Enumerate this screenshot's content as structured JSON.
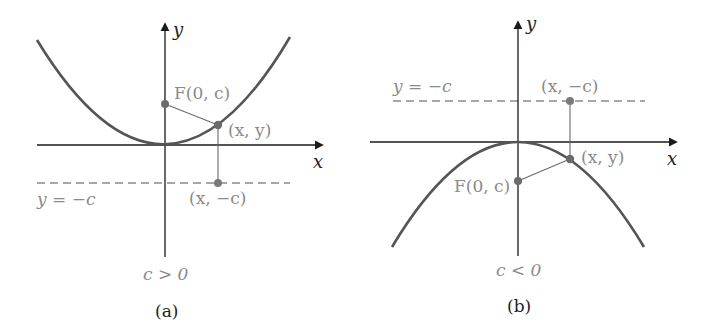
{
  "figure": {
    "panels": [
      {
        "id": "a",
        "caption": "(a)",
        "condition": "c > 0",
        "axis_x_label": "x",
        "axis_y_label": "y",
        "focus_label": "F(0, c)",
        "point_label": "(x, y)",
        "directrix_point_label": "(x, −c)",
        "directrix_label": "y = −c",
        "parabola": "opens upward"
      },
      {
        "id": "b",
        "caption": "(b)",
        "condition": "c < 0",
        "axis_x_label": "x",
        "axis_y_label": "y",
        "focus_label": "F(0, c)",
        "point_label": "(x, y)",
        "directrix_point_label": "(x, −c)",
        "directrix_label": "y = −c",
        "parabola": "opens downward"
      }
    ],
    "colors": {
      "curve": "#555555",
      "axes": "#1a1a1a",
      "point": "#6b6b6b",
      "dashed": "#8a8a8a",
      "segments": "#6b6b6b",
      "labels_gray": "#8a8a8a"
    }
  }
}
